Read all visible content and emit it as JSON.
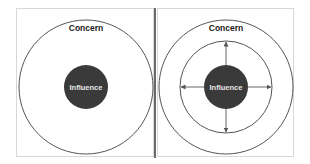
{
  "diagram": {
    "colors": {
      "background": "#ffffff",
      "frame": "#d8d8d8",
      "circle_stroke": "#555555",
      "influence_fill": "#3a3a3a",
      "influence_text": "#e8e8e8",
      "concern_text": "#222222",
      "separator": "#444444",
      "arrow": "#666666"
    },
    "panels": [
      {
        "id": "left",
        "description": "Reactive focus: small influence inside large concern",
        "concern_label": "Concern",
        "influence_label": "Influence",
        "circles": [
          "concern-outer",
          "influence-core"
        ]
      },
      {
        "id": "right",
        "description": "Proactive focus: influence expanding outward",
        "concern_label": "Concern",
        "influence_label": "Influence",
        "circles": [
          "concern-outer",
          "expanded-influence-ring",
          "influence-core"
        ],
        "arrows": [
          "up",
          "down",
          "left",
          "right"
        ]
      }
    ]
  }
}
